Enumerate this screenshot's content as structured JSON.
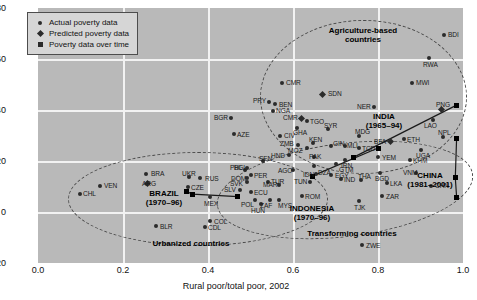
{
  "chart_data": {
    "type": "scatter",
    "title": "",
    "xlabel": "Rural poor/total poor, 2002",
    "ylabel": "",
    "xlim": [
      0.0,
      1.0
    ],
    "ylim": [
      -20,
      80
    ],
    "xticks": [
      "0.0",
      "0.2",
      "0.4",
      "0.6",
      "0.8",
      "1.0"
    ],
    "yticks": [
      "80",
      "60",
      "40",
      "20",
      "0",
      "-20"
    ],
    "grid": true,
    "legend_position": "top-left",
    "legend": [
      {
        "marker": "circle",
        "label": "Actual poverty data"
      },
      {
        "marker": "diamond",
        "label": "Predicted poverty data"
      },
      {
        "marker": "square",
        "label": "Poverty data over time"
      }
    ],
    "clusters": [
      {
        "name": "Agriculture-based countries",
        "label": "Agriculture-based\ncountries"
      },
      {
        "name": "Transforming countries",
        "label": "Transforming countries"
      },
      {
        "name": "Urbanized countries",
        "label": "Urbanized countries"
      }
    ],
    "series_annotations": [
      {
        "country": "INDIA",
        "period": "(1965–94)"
      },
      {
        "country": "CHINA",
        "period": "(1981–2001)"
      },
      {
        "country": "BRAZIL",
        "period": "(1970–96)"
      },
      {
        "country": "INDONESIA",
        "period": "(1970–96)"
      }
    ],
    "points": [
      {
        "code": "BDI",
        "x": 0.955,
        "y": 69.0,
        "marker": "circle",
        "lpos": "right"
      },
      {
        "code": "RWA",
        "x": 0.92,
        "y": 60.0,
        "marker": "circle",
        "lpos": "below"
      },
      {
        "code": "MWI",
        "x": 0.88,
        "y": 50.5,
        "marker": "circle",
        "lpos": "right"
      },
      {
        "code": "CMR",
        "x": 0.575,
        "y": 50.5,
        "marker": "circle",
        "lpos": "right"
      },
      {
        "code": "SDN",
        "x": 0.67,
        "y": 46.0,
        "marker": "diamond",
        "lpos": "right"
      },
      {
        "code": "PRY",
        "x": 0.543,
        "y": 43.0,
        "marker": "circle",
        "lpos": "above-left"
      },
      {
        "code": "BEN",
        "x": 0.558,
        "y": 42.0,
        "marker": "circle",
        "lpos": "right"
      },
      {
        "code": "NGA",
        "x": 0.552,
        "y": 39.5,
        "marker": "circle",
        "lpos": "right"
      },
      {
        "code": "NER",
        "x": 0.79,
        "y": 41.0,
        "marker": "circle",
        "lpos": "left"
      },
      {
        "code": "PNG",
        "x": 0.95,
        "y": 40.0,
        "marker": "diamond",
        "lpos": "above"
      },
      {
        "code": "CMR",
        "x": 0.62,
        "y": 36.5,
        "marker": "diamond",
        "lpos": "left"
      },
      {
        "code": "TGO",
        "x": 0.632,
        "y": 35.5,
        "marker": "circle",
        "lpos": "right"
      },
      {
        "code": "LAO",
        "x": 0.93,
        "y": 36.0,
        "marker": "circle",
        "lpos": "right"
      },
      {
        "code": "BGR",
        "x": 0.455,
        "y": 36.5,
        "marker": "circle",
        "lpos": "left"
      },
      {
        "code": "GHA",
        "x": 0.61,
        "y": 32.5,
        "marker": "circle",
        "lpos": "right"
      },
      {
        "code": "SYR",
        "x": 0.682,
        "y": 32.0,
        "marker": "circle",
        "lpos": "above"
      },
      {
        "code": "AZE",
        "x": 0.46,
        "y": 30.0,
        "marker": "circle",
        "lpos": "right"
      },
      {
        "code": "CIV",
        "x": 0.57,
        "y": 29.5,
        "marker": "circle",
        "lpos": "right"
      },
      {
        "code": "MDG",
        "x": 0.755,
        "y": 29.5,
        "marker": "circle",
        "lpos": "above"
      },
      {
        "code": "NPL",
        "x": 0.952,
        "y": 29.0,
        "marker": "circle",
        "lpos": "above"
      },
      {
        "code": "ETH",
        "x": 0.86,
        "y": 28.0,
        "marker": "circle",
        "lpos": "right"
      },
      {
        "code": "BFA",
        "x": 0.83,
        "y": 27.0,
        "marker": "diamond",
        "lpos": "left"
      },
      {
        "code": "KEN",
        "x": 0.648,
        "y": 26.5,
        "marker": "circle",
        "lpos": "above"
      },
      {
        "code": "ZMB",
        "x": 0.612,
        "y": 26.0,
        "marker": "circle",
        "lpos": "left"
      },
      {
        "code": "GIN",
        "x": 0.69,
        "y": 25.5,
        "marker": "circle",
        "lpos": "left"
      },
      {
        "code": "MLI",
        "x": 0.722,
        "y": 25.5,
        "marker": "circle",
        "lpos": "right"
      },
      {
        "code": "MOZ",
        "x": 0.632,
        "y": 24.5,
        "marker": "circle",
        "lpos": "left"
      },
      {
        "code": "TCD",
        "x": 0.755,
        "y": 24.5,
        "marker": "circle",
        "lpos": "right"
      },
      {
        "code": "UGA",
        "x": 0.9,
        "y": 24.0,
        "marker": "circle",
        "lpos": "below"
      },
      {
        "code": "HND",
        "x": 0.59,
        "y": 22.0,
        "marker": "circle",
        "lpos": "left"
      },
      {
        "code": "PAK",
        "x": 0.65,
        "y": 21.0,
        "marker": "circle",
        "lpos": "above"
      },
      {
        "code": "IRN",
        "x": 0.722,
        "y": 20.0,
        "marker": "circle",
        "lpos": "below"
      },
      {
        "code": "YEM",
        "x": 0.8,
        "y": 21.0,
        "marker": "circle",
        "lpos": "right"
      },
      {
        "code": "KHM",
        "x": 0.875,
        "y": 19.0,
        "marker": "circle",
        "lpos": "right"
      },
      {
        "code": "GTM",
        "x": 0.7,
        "y": 17.5,
        "marker": "circle",
        "lpos": "right"
      },
      {
        "code": "DZA",
        "x": 0.65,
        "y": 16.5,
        "marker": "circle",
        "lpos": "right"
      },
      {
        "code": "SEN",
        "x": 0.53,
        "y": 18.5,
        "marker": "circle",
        "lpos": "above"
      },
      {
        "code": "BGL",
        "x": 0.492,
        "y": 16.0,
        "marker": "circle",
        "lpos": "right"
      },
      {
        "code": "IDN",
        "x": 0.655,
        "y": 13.5,
        "marker": "circle",
        "lpos": "left"
      },
      {
        "code": "EGY",
        "x": 0.69,
        "y": 13.0,
        "marker": "circle",
        "lpos": "right"
      },
      {
        "code": "AGO",
        "x": 0.6,
        "y": 15.0,
        "marker": "circle",
        "lpos": "right"
      },
      {
        "code": "BGD",
        "x": 0.805,
        "y": 14.0,
        "marker": "circle",
        "lpos": "below"
      },
      {
        "code": "VNM",
        "x": 0.89,
        "y": 14.0,
        "marker": "circle",
        "lpos": "left"
      },
      {
        "code": "PER",
        "x": 0.5,
        "y": 13.0,
        "marker": "circle",
        "lpos": "right"
      },
      {
        "code": "PHL",
        "x": 0.487,
        "y": 15.0,
        "marker": "circle",
        "lpos": "above-left"
      },
      {
        "code": "DOM",
        "x": 0.492,
        "y": 12.0,
        "marker": "circle",
        "lpos": "left"
      },
      {
        "code": "BRA",
        "x": 0.255,
        "y": 13.0,
        "marker": "circle",
        "lpos": "right"
      },
      {
        "code": "UKR",
        "x": 0.355,
        "y": 10.5,
        "marker": "circle",
        "lpos": "above"
      },
      {
        "code": "RUS",
        "x": 0.382,
        "y": 10.0,
        "marker": "circle",
        "lpos": "right"
      },
      {
        "code": "ARG",
        "x": 0.258,
        "y": 8.0,
        "marker": "diamond",
        "lpos": "above"
      },
      {
        "code": "SVK",
        "x": 0.492,
        "y": 8.5,
        "marker": "circle",
        "lpos": "left"
      },
      {
        "code": "TUR",
        "x": 0.54,
        "y": 8.5,
        "marker": "circle",
        "lpos": "right"
      },
      {
        "code": "IND",
        "x": 0.712,
        "y": 9.5,
        "marker": "circle",
        "lpos": "right"
      },
      {
        "code": "TUN",
        "x": 0.64,
        "y": 8.5,
        "marker": "circle",
        "lpos": "left"
      },
      {
        "code": "THA",
        "x": 0.76,
        "y": 9.0,
        "marker": "circle",
        "lpos": "above"
      },
      {
        "code": "LKA",
        "x": 0.82,
        "y": 8.0,
        "marker": "circle",
        "lpos": "right"
      },
      {
        "code": "CHN",
        "x": 0.925,
        "y": 7.0,
        "marker": "circle",
        "lpos": "right"
      },
      {
        "code": "MAR",
        "x": 0.568,
        "y": 7.5,
        "marker": "circle",
        "lpos": "left"
      },
      {
        "code": "CZE",
        "x": 0.352,
        "y": 6.5,
        "marker": "circle",
        "lpos": "right"
      },
      {
        "code": "VEN",
        "x": 0.145,
        "y": 8.0,
        "marker": "circle",
        "lpos": "right"
      },
      {
        "code": "SLV",
        "x": 0.475,
        "y": 5.5,
        "marker": "circle",
        "lpos": "left"
      },
      {
        "code": "ECU",
        "x": 0.5,
        "y": 4.5,
        "marker": "circle",
        "lpos": "right"
      },
      {
        "code": "CHL",
        "x": 0.098,
        "y": 4.0,
        "marker": "circle",
        "lpos": "right"
      },
      {
        "code": "MEX",
        "x": 0.405,
        "y": 3.0,
        "marker": "circle",
        "lpos": "below"
      },
      {
        "code": "ROM",
        "x": 0.62,
        "y": 3.5,
        "marker": "circle",
        "lpos": "right"
      },
      {
        "code": "ZAR",
        "x": 0.81,
        "y": 3.5,
        "marker": "circle",
        "lpos": "right"
      },
      {
        "code": "POL",
        "x": 0.51,
        "y": 2.0,
        "marker": "circle",
        "lpos": "below-left"
      },
      {
        "code": "ZAF",
        "x": 0.545,
        "y": 2.0,
        "marker": "circle",
        "lpos": "right"
      },
      {
        "code": "MYS",
        "x": 0.568,
        "y": 2.0,
        "marker": "circle",
        "lpos": "right"
      },
      {
        "code": "HUN",
        "x": 0.525,
        "y": 0.5,
        "marker": "circle",
        "lpos": "below"
      },
      {
        "code": "TJK",
        "x": 0.755,
        "y": 1.5,
        "marker": "circle",
        "lpos": "below"
      },
      {
        "code": "COL",
        "x": 0.405,
        "y": -3.5,
        "marker": "circle",
        "lpos": "right"
      },
      {
        "code": "BLR",
        "x": 0.278,
        "y": -5.5,
        "marker": "circle",
        "lpos": "right"
      },
      {
        "code": "CDL",
        "x": 0.392,
        "y": -6.0,
        "marker": "circle",
        "lpos": "right"
      },
      {
        "code": "ZWE",
        "x": 0.762,
        "y": -13.0,
        "marker": "circle",
        "lpos": "right"
      }
    ],
    "time_series": [
      {
        "name": "INDIA",
        "points": [
          {
            "x": 0.818,
            "y": 42.5
          },
          {
            "x": 0.742,
            "y": 22.0
          }
        ]
      },
      {
        "name": "CHINA",
        "points": [
          {
            "x": 0.985,
            "y": 29.0
          },
          {
            "x": 0.982,
            "y": 13.5
          },
          {
            "x": 0.985,
            "y": 6.0
          }
        ]
      },
      {
        "name": "INDONESIA",
        "points": [
          {
            "x": 0.8,
            "y": 17.5
          },
          {
            "x": 0.645,
            "y": 6.5
          }
        ]
      },
      {
        "name": "BRAZIL",
        "points": [
          {
            "x": 0.35,
            "y": 8.0
          },
          {
            "x": 0.363,
            "y": 7.0
          },
          {
            "x": 0.47,
            "y": 6.0
          }
        ]
      }
    ]
  }
}
